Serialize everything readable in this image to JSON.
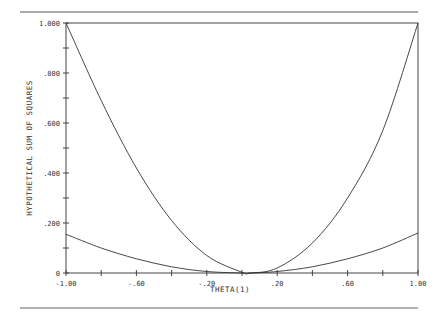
{
  "chart_data": {
    "type": "line",
    "title": "",
    "xlabel": "THETA(1)",
    "ylabel": "HYPOTHETICAL SUM OF SQUARES",
    "xlim": [
      -1.0,
      1.0
    ],
    "ylim": [
      0,
      1.0
    ],
    "grid": false,
    "legend": null,
    "x_ticks": [
      -1.0,
      -0.8,
      -0.6,
      -0.4,
      -0.2,
      0.0,
      0.2,
      0.4,
      0.6,
      0.8,
      1.0
    ],
    "x_tick_labels": [
      {
        "value": -1.0,
        "label": "-1.00"
      },
      {
        "value": -0.6,
        "label": "-.60"
      },
      {
        "value": -0.2,
        "label": "-.20"
      },
      {
        "value": 0.2,
        "label": ".20"
      },
      {
        "value": 0.6,
        "label": ".60"
      },
      {
        "value": 1.0,
        "label": "1.00"
      }
    ],
    "y_ticks": [
      0,
      0.1,
      0.2,
      0.3,
      0.4,
      0.5,
      0.6,
      0.7,
      0.8,
      0.9,
      1.0
    ],
    "y_tick_labels": [
      {
        "value": 0,
        "label": "0"
      },
      {
        "value": 0.2,
        "label": ".200"
      },
      {
        "value": 0.4,
        "label": ".400"
      },
      {
        "value": 0.6,
        "label": ".600"
      },
      {
        "value": 0.8,
        "label": ".800"
      },
      {
        "value": 1.0,
        "label": "1.000"
      }
    ],
    "x": [
      -1.0,
      -0.8,
      -0.6,
      -0.4,
      -0.2,
      0.0,
      0.05,
      0.2,
      0.4,
      0.6,
      0.8,
      1.0
    ],
    "series": [
      {
        "name": "steep curve",
        "values": [
          1.0,
          0.69,
          0.42,
          0.21,
          0.07,
          0.003,
          0.0,
          0.02,
          0.12,
          0.3,
          0.57,
          1.0
        ]
      },
      {
        "name": "shallow curve",
        "values": [
          0.155,
          0.1,
          0.057,
          0.025,
          0.006,
          0.0,
          0.0,
          0.006,
          0.025,
          0.057,
          0.1,
          0.16
        ]
      }
    ]
  }
}
